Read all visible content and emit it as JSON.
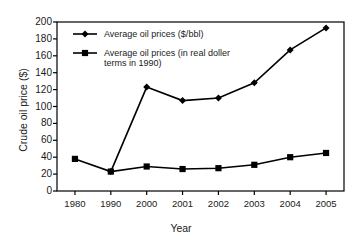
{
  "chart_data": {
    "type": "line",
    "title": "",
    "xlabel": "Year",
    "ylabel": "Crude oil price ($)",
    "categories": [
      "1980",
      "1990",
      "2000",
      "2001",
      "2002",
      "2003",
      "2004",
      "2005"
    ],
    "ylim": [
      0,
      200
    ],
    "yticks": [
      "0",
      "20",
      "40",
      "60",
      "80",
      "100",
      "120",
      "140",
      "160",
      "180",
      "200"
    ],
    "grid": false,
    "legend_position": "top-left",
    "series": [
      {
        "name": "Average oil prices ($/bbl)",
        "marker": "diamond",
        "values": [
          null,
          23,
          123,
          107,
          110,
          128,
          167,
          193
        ]
      },
      {
        "name": "Average oil prices (in real doller terms in 1990)",
        "name_line1": "Average oil prices (in real doller",
        "name_line2": "terms in 1990)",
        "marker": "square",
        "values": [
          38,
          23,
          29,
          26,
          27,
          31,
          40,
          45
        ]
      }
    ],
    "colors": {
      "line": "#000000",
      "axis": "#000000",
      "background": "#ffffff",
      "text": "#1a1a1a"
    }
  },
  "legend": {
    "entry1": "Average oil prices ($/bbl)",
    "entry2_line1": "Average oil prices (in real doller",
    "entry2_line2": "terms in 1990)"
  },
  "axes": {
    "y_title": "Crude oil price ($)",
    "x_title": "Year"
  }
}
